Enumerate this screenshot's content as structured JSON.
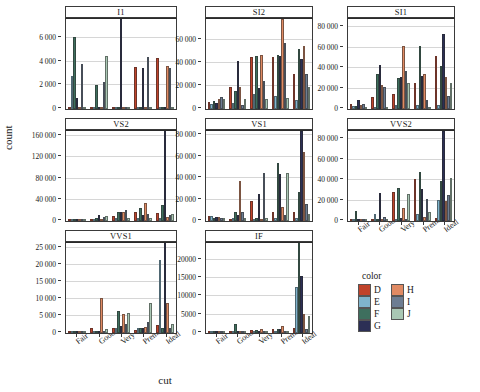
{
  "chart_data": {
    "type": "bar",
    "title": "",
    "xlabel": "cut",
    "ylabel": "count",
    "grid": true,
    "legend_title": "color",
    "legend_position": "bottom-right",
    "categories": [
      "Fair",
      "Good",
      "Very Good",
      "Premium",
      "Ideal"
    ],
    "series_names": [
      "D",
      "E",
      "F",
      "G",
      "H",
      "I",
      "J"
    ],
    "series_colors": {
      "D": "#c0432b",
      "E": "#7fb4cc",
      "F": "#3e6f5e",
      "G": "#2c2f55",
      "H": "#e08a63",
      "I": "#6d7d92",
      "J": "#a9c7b4"
    },
    "facet_variable": "clarity",
    "facets": [
      {
        "name": "I1",
        "ylim": [
          0,
          7600
        ],
        "yticks": [
          0,
          2000,
          4000,
          6000
        ],
        "ytick_labels": [
          "0",
          "2 000",
          "4 000",
          "6 000"
        ],
        "series": [
          {
            "name": "D",
            "values": [
              0,
              0,
              0,
              3550,
              4350
            ]
          },
          {
            "name": "E",
            "values": [
              2750,
              0,
              0,
              0,
              0
            ]
          },
          {
            "name": "F",
            "values": [
              6100,
              2050,
              0,
              0,
              0
            ]
          },
          {
            "name": "G",
            "values": [
              900,
              0,
              7600,
              3450,
              0
            ]
          },
          {
            "name": "H",
            "values": [
              0,
              0,
              0,
              0,
              3650
            ]
          },
          {
            "name": "I",
            "values": [
              3800,
              2300,
              0,
              4400,
              3480
            ]
          },
          {
            "name": "J",
            "values": [
              0,
              4450,
              0,
              0,
              0
            ]
          }
        ]
      },
      {
        "name": "SI2",
        "ylim": [
          0,
          78000
        ],
        "yticks": [
          0,
          20000,
          40000,
          60000
        ],
        "ytick_labels": [
          "0",
          "20 000",
          "40 000",
          "60 000"
        ],
        "series": [
          {
            "name": "D",
            "values": [
              6000,
              19000,
              45000,
              45500,
              30000
            ]
          },
          {
            "name": "E",
            "values": [
              4000,
              5500,
              13000,
              11000,
              8000
            ]
          },
          {
            "name": "F",
            "values": [
              7000,
              15500,
              46000,
              47000,
              52000
            ]
          },
          {
            "name": "G",
            "values": [
              5000,
              42000,
              18000,
              46000,
              43000
            ]
          },
          {
            "name": "H",
            "values": [
              9000,
              19000,
              47000,
              78000,
              55000
            ]
          },
          {
            "name": "I",
            "values": [
              10500,
              3500,
              24500,
              57000,
              30000
            ]
          },
          {
            "name": "J",
            "values": [
              9000,
              9000,
              9000,
              9500,
              19000
            ]
          }
        ]
      },
      {
        "name": "SI1",
        "ylim": [
          0,
          88000
        ],
        "yticks": [
          0,
          20000,
          40000,
          60000,
          80000
        ],
        "ytick_labels": [
          "0",
          "20 000",
          "40 000",
          "60 000",
          "80 000"
        ],
        "series": [
          {
            "name": "D",
            "values": [
              5000,
              12000,
              15000,
              25500,
              52000
            ]
          },
          {
            "name": "E",
            "values": [
              3000,
              2000,
              4000,
              4000,
              4000
            ]
          },
          {
            "name": "F",
            "values": [
              3000,
              34500,
              30500,
              62000,
              42500
            ]
          },
          {
            "name": "G",
            "values": [
              8500,
              43000,
              31000,
              32000,
              73000
            ]
          },
          {
            "name": "H",
            "values": [
              4000,
              23500,
              61500,
              34500,
              31000
            ]
          },
          {
            "name": "I",
            "values": [
              4500,
              21500,
              37000,
              9000,
              12500
            ]
          },
          {
            "name": "J",
            "values": [
              1200,
              2000,
              25000,
              1500,
              25000
            ]
          }
        ]
      },
      {
        "name": "VS2",
        "ylim": [
          0,
          170000
        ],
        "yticks": [
          0,
          40000,
          80000,
          120000,
          160000
        ],
        "ytick_labels": [
          "0",
          "40 000",
          "80 000",
          "120 000",
          "160 000"
        ],
        "series": [
          {
            "name": "D",
            "values": [
              3000,
              2000,
              9000,
              17000,
              14500
            ]
          },
          {
            "name": "E",
            "values": [
              2000,
              1500,
              5000,
              5000,
              6000
            ]
          },
          {
            "name": "F",
            "values": [
              4000,
              6000,
              17500,
              25000,
              30500
            ]
          },
          {
            "name": "G",
            "values": [
              4500,
              11000,
              16500,
              12000,
              170000
            ]
          },
          {
            "name": "H",
            "values": [
              2500,
              4500,
              17000,
              34000,
              7500
            ]
          },
          {
            "name": "I",
            "values": [
              2000,
              7500,
              20500,
              13500,
              11500
            ]
          },
          {
            "name": "J",
            "values": [
              2500,
              9000,
              6500,
              6500,
              14000
            ]
          }
        ]
      },
      {
        "name": "VS1",
        "ylim": [
          0,
          84000
        ],
        "yticks": [
          0,
          20000,
          40000,
          60000,
          80000
        ],
        "ytick_labels": [
          "0",
          "20 000",
          "40 000",
          "60 000",
          "80 000"
        ],
        "series": [
          {
            "name": "D",
            "values": [
              5000,
              1500,
              19000,
              8000,
              8000
            ]
          },
          {
            "name": "E",
            "values": [
              4500,
              3000,
              1500,
              3000,
              3000
            ]
          },
          {
            "name": "F",
            "values": [
              3000,
              8000,
              3000,
              54000,
              27500
            ]
          },
          {
            "name": "G",
            "values": [
              4000,
              5500,
              25000,
              44000,
              84000
            ]
          },
          {
            "name": "H",
            "values": [
              3500,
              37000,
              1500,
              13000,
              64500
            ]
          },
          {
            "name": "I",
            "values": [
              3000,
              8000,
              45000,
              6000,
              16000
            ]
          },
          {
            "name": "J",
            "values": [
              3000,
              3000,
              3000,
              45000,
              7000
            ]
          }
        ]
      },
      {
        "name": "VVS2",
        "ylim": [
          0,
          88000
        ],
        "yticks": [
          0,
          20000,
          40000,
          60000,
          80000
        ],
        "ytick_labels": [
          "0",
          "20 000",
          "40 000",
          "60 000",
          "80 000"
        ],
        "series": [
          {
            "name": "D",
            "values": [
              2000,
              1000,
              28000,
              41000,
              2500
            ]
          },
          {
            "name": "E",
            "values": [
              1500,
              6500,
              2000,
              7000,
              21000
            ]
          },
          {
            "name": "F",
            "values": [
              10000,
              1000,
              32000,
              48000,
              39000
            ]
          },
          {
            "name": "G",
            "values": [
              1000,
              27000,
              3000,
              31000,
              88000
            ]
          },
          {
            "name": "H",
            "values": [
              1000,
              1000,
              13000,
              3500,
              20000
            ]
          },
          {
            "name": "I",
            "values": [
              1000,
              4000,
              1500,
              22000,
              25000
            ]
          },
          {
            "name": "J",
            "values": [
              1000,
              1000,
              26000,
              8500,
              42000
            ]
          }
        ]
      },
      {
        "name": "VVS1",
        "ylim": [
          0,
          26500
        ],
        "yticks": [
          0,
          5000,
          10000,
          15000,
          20000,
          25000
        ],
        "ytick_labels": [
          "0",
          "5 000",
          "10 000",
          "15 000",
          "20 000",
          "25 000"
        ],
        "series": [
          {
            "name": "D",
            "values": [
              200,
              1500,
              1400,
              1000,
              2300
            ]
          },
          {
            "name": "E",
            "values": [
              150,
              300,
              1500,
              1400,
              21500
            ]
          },
          {
            "name": "F",
            "values": [
              150,
              300,
              6500,
              1600,
              1500
            ]
          },
          {
            "name": "G",
            "values": [
              150,
              400,
              2000,
              1600,
              26500
            ]
          },
          {
            "name": "H",
            "values": [
              150,
              10400,
              5500,
              1800,
              8700
            ]
          },
          {
            "name": "I",
            "values": [
              150,
              300,
              2800,
              3300,
              1400
            ]
          },
          {
            "name": "J",
            "values": [
              150,
              1200,
              6000,
              8700,
              2800
            ]
          }
        ]
      },
      {
        "name": "IF",
        "ylim": [
          0,
          24500
        ],
        "yticks": [
          0,
          5000,
          10000,
          15000,
          20000
        ],
        "ytick_labels": [
          "0",
          "5000",
          "10000",
          "15000",
          "20000"
        ],
        "series": [
          {
            "name": "D",
            "values": [
              120,
              600,
              900,
              1100,
              1500
            ]
          },
          {
            "name": "E",
            "values": [
              100,
              200,
              300,
              400,
              12500
            ]
          },
          {
            "name": "F",
            "values": [
              100,
              2500,
              900,
              1000,
              24500
            ]
          },
          {
            "name": "G",
            "values": [
              100,
              200,
              300,
              1200,
              15500
            ]
          },
          {
            "name": "H",
            "values": [
              100,
              200,
              1000,
              1900,
              5100
            ]
          },
          {
            "name": "I",
            "values": [
              100,
              200,
              250,
              350,
              1200
            ]
          },
          {
            "name": "J",
            "values": [
              100,
              200,
              250,
              350,
              4700
            ]
          }
        ]
      }
    ]
  },
  "legend": {
    "title": "color",
    "column_a": [
      "D",
      "E",
      "F",
      "G"
    ],
    "column_b": [
      "H",
      "I",
      "J"
    ]
  }
}
